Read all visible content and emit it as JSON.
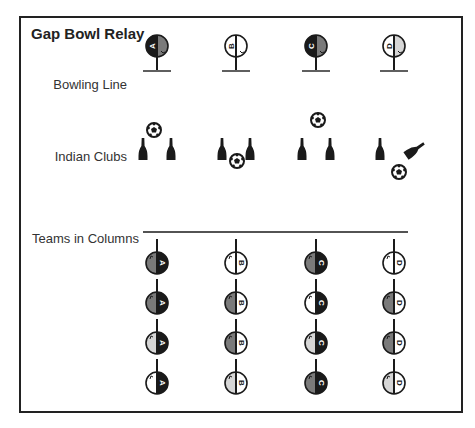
{
  "title": "Gap Bowl Relay",
  "rows": {
    "bowling_line": "Bowling Line",
    "indian_clubs": "Indian Clubs",
    "teams_in_columns": "Teams in Columns"
  },
  "teams": [
    "A",
    "B",
    "C",
    "D"
  ],
  "colors": {
    "black": "#1a1a1a",
    "dark_gray": "#7a7a7a",
    "light_gray": "#d6d6d6",
    "white": "#ffffff",
    "frame": "#222222"
  },
  "bowling_line_players": [
    {
      "team": "A",
      "left": "black",
      "right": "dark_gray"
    },
    {
      "team": "B",
      "left": "white",
      "right": "white"
    },
    {
      "team": "C",
      "left": "black",
      "right": "dark_gray"
    },
    {
      "team": "D",
      "left": "white",
      "right": "light_gray"
    }
  ],
  "indian_clubs_setups": [
    {
      "ball": "above-between"
    },
    {
      "ball": "below-between"
    },
    {
      "ball": "high-above"
    },
    {
      "ball": "below-right",
      "right_club": "knocked-over"
    }
  ],
  "team_columns": [
    {
      "team": "A",
      "players": [
        {
          "left": "dark_gray",
          "right": "black"
        },
        {
          "left": "dark_gray",
          "right": "black"
        },
        {
          "left": "light_gray",
          "right": "black"
        },
        {
          "left": "white",
          "right": "black"
        }
      ]
    },
    {
      "team": "B",
      "players": [
        {
          "left": "white",
          "right": "white"
        },
        {
          "left": "dark_gray",
          "right": "white"
        },
        {
          "left": "dark_gray",
          "right": "white"
        },
        {
          "left": "light_gray",
          "right": "white"
        }
      ]
    },
    {
      "team": "C",
      "players": [
        {
          "left": "dark_gray",
          "right": "black"
        },
        {
          "left": "white",
          "right": "black"
        },
        {
          "left": "light_gray",
          "right": "black"
        },
        {
          "left": "dark_gray",
          "right": "black"
        }
      ]
    },
    {
      "team": "D",
      "players": [
        {
          "left": "white",
          "right": "white"
        },
        {
          "left": "dark_gray",
          "right": "white"
        },
        {
          "left": "dark_gray",
          "right": "white"
        },
        {
          "left": "light_gray",
          "right": "white"
        }
      ]
    }
  ]
}
